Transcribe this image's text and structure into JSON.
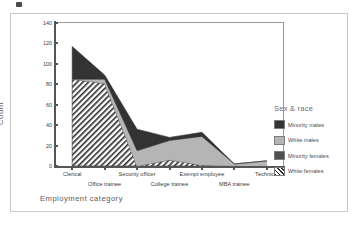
{
  "chart_data": {
    "type": "area",
    "stacked": true,
    "title": "",
    "xlabel": "Employment category",
    "ylabel": "Count",
    "ylim": [
      0,
      140
    ],
    "yticks": [
      0,
      20,
      40,
      60,
      80,
      100,
      120,
      140
    ],
    "grid": false,
    "legend_title": "Sex & race",
    "legend_position": "right",
    "categories": [
      "Clerical",
      "Office trainee",
      "Security officer",
      "College trainee",
      "Exempt employee",
      "MBA trainee",
      "Technical"
    ],
    "series": [
      {
        "name": "White females",
        "fill": "hatch",
        "color": "#2b2b2b",
        "values": [
          85,
          81,
          0,
          6,
          1,
          0,
          0
        ]
      },
      {
        "name": "Minority females",
        "fill": "solid",
        "color": "#4f4f4f",
        "values": [
          0,
          0,
          0,
          0,
          0,
          0,
          0
        ]
      },
      {
        "name": "White males",
        "fill": "solid",
        "color": "#b5b5b5",
        "values": [
          0,
          4,
          15,
          19,
          28,
          2,
          5
        ]
      },
      {
        "name": "Minority males",
        "fill": "solid",
        "color": "#333333",
        "values": [
          32,
          4,
          21,
          3,
          4,
          0,
          0
        ]
      }
    ],
    "series_totals": [
      117,
      89,
      36,
      28,
      33,
      2,
      5
    ],
    "annotations": []
  },
  "axes": {
    "y_title": "Count",
    "x_title": "Employment category",
    "y_ticks": [
      "140",
      "120",
      "100",
      "80",
      "60",
      "40",
      "20",
      "0"
    ]
  },
  "legend": {
    "title": "Sex & race",
    "items": [
      {
        "label": "Minority males",
        "swatch": "dark-solid-swatch"
      },
      {
        "label": "White males",
        "swatch": "light-gray-solid-swatch"
      },
      {
        "label": "Minority females",
        "swatch": "medium-gray-solid-swatch"
      },
      {
        "label": "White females",
        "swatch": "diagonal-hatch-swatch"
      }
    ]
  },
  "x_labels": [
    {
      "text": "Clerical",
      "row": 1
    },
    {
      "text": "Office trainee",
      "row": 2
    },
    {
      "text": "Security officer",
      "row": 1
    },
    {
      "text": "College trainee",
      "row": 2
    },
    {
      "text": "Exempt employee",
      "row": 1
    },
    {
      "text": "MBA trainee",
      "row": 2
    },
    {
      "text": "Technical",
      "row": 1
    }
  ],
  "colors": {
    "minority_males": "#333333",
    "white_males": "#b5b5b5",
    "minority_females": "#4f4f4f",
    "white_females_hatch": "#2b2b2b",
    "axis": "#555555",
    "frame": "#9a9a9a",
    "outer_frame": "#c9c9c9",
    "text": "#3d3d3d",
    "title_text": "#5a5a5a"
  }
}
